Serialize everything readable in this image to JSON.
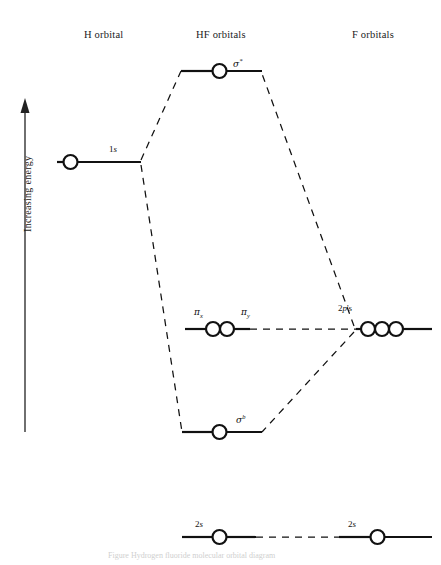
{
  "figure": {
    "kind": "molecular-orbital-energy-level-diagram",
    "molecule": "HF",
    "axis": {
      "label": "Increasing energy",
      "direction": "up",
      "arrow_top_y": 100,
      "arrow_bottom_y": 432
    },
    "caption": "Figure  Hydrogen fluoride molecular orbital diagram"
  },
  "columns": [
    {
      "id": "left",
      "label": "H orbital"
    },
    {
      "id": "center",
      "label": "HF orbitals"
    },
    {
      "id": "right",
      "label": "F orbitals"
    }
  ],
  "levels": {
    "h_1s": {
      "label_plain": "1s",
      "label_main": "1",
      "label_italic": "s",
      "electrons": 1,
      "column": "left"
    },
    "sigma_star": {
      "label_plain": "σ*",
      "greek": "σ",
      "superscript": "*",
      "electrons": 1,
      "column": "center"
    },
    "pi_x": {
      "label_plain": "πx",
      "greek": "π",
      "subscript": "x",
      "column": "center"
    },
    "pi_y": {
      "label_plain": "πy",
      "greek": "π",
      "subscript": "y",
      "column": "center"
    },
    "sigma_b": {
      "label_plain": "σb",
      "greek": "σ",
      "superscript": "b",
      "electrons": 1,
      "column": "center"
    },
    "f_2p": {
      "label_plain": "2p's",
      "label_main": "2",
      "label_italic": "p",
      "label_tail": "'s",
      "electrons": 3,
      "column": "right"
    },
    "hf_2s": {
      "label_plain": "2s",
      "label_main": "2",
      "label_italic": "s",
      "electrons": 1,
      "column": "center"
    },
    "f_2s": {
      "label_plain": "2s",
      "label_main": "2",
      "label_italic": "s",
      "electrons": 1,
      "column": "right"
    }
  },
  "colors": {
    "ink": "#111111",
    "background": "#ffffff",
    "axis": "#333333",
    "caption": "#cfcfcf"
  }
}
